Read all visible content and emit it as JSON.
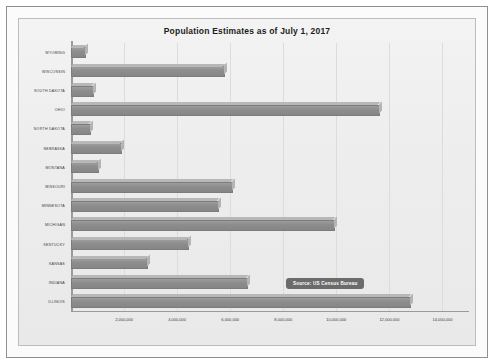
{
  "chart_data": {
    "type": "bar",
    "orientation": "horizontal",
    "title": "Population Estimates as of July 1, 2017",
    "xlabel": "",
    "ylabel": "",
    "xlim": [
      0,
      15000000
    ],
    "tick_interval": 2000000,
    "grid": true,
    "legend": "none",
    "bar_color": "#8d8d8d",
    "categories": [
      "ILLINOIS",
      "INDIANA",
      "KANSAS",
      "KENTUCKY",
      "MICHIGAN",
      "MINNESOTA",
      "MISSOURI",
      "MONTANA",
      "NEBRASKA",
      "NORTH DAKOTA",
      "OHIO",
      "SOUTH DAKOTA",
      "WISCONSIN",
      "WYOMING"
    ],
    "values": [
      12800000,
      6670000,
      2910000,
      4450000,
      9960000,
      5580000,
      6110000,
      1050000,
      1920000,
      755000,
      11660000,
      870000,
      5800000,
      580000
    ],
    "xticks": [
      2000000,
      4000000,
      6000000,
      8000000,
      10000000,
      12000000,
      14000000
    ],
    "xticklabels": [
      "2,000,000",
      "4,000,000",
      "6,000,000",
      "8,000,000",
      "10,000,000",
      "12,000,000",
      "14,000,000"
    ],
    "annotations": [
      {
        "text": "Source: US Census Bureau",
        "x": 8100000,
        "category": "INDIANA"
      }
    ]
  }
}
